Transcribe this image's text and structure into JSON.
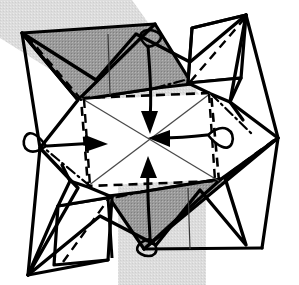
{
  "figure": {
    "name": "origami-step-diagram",
    "type": "line-drawing",
    "width": 299,
    "height": 285
  },
  "colors": {
    "background": "#ffffff",
    "backdrop_band": "#d9d9d9",
    "shaded_face": "#9a9a9a",
    "shaded_face_dark": "#8e8e8e",
    "white_face": "#ffffff",
    "outline": "#000000",
    "thin_line": "#4a4a4a",
    "arrow": "#000000"
  },
  "geometry": {
    "backdrop_band": {
      "name": "background-shadow-band",
      "points": "0,0 132,0 206,104 206,285 118,285 118,112 0,38"
    },
    "outer_silhouette": {
      "name": "model-outer-outline",
      "points": "22,33 78,100 40,148 78,188 28,275 100,216 156,245 200,190 246,245 225,178 278,138 230,102 246,15 190,62 136,34 96,80"
    },
    "faces": [
      {
        "name": "face-top-left-shaded",
        "fill": "shaded_face",
        "points": "22,33 155,24 157,88 78,100"
      },
      {
        "name": "face-top-middle-shaded",
        "fill": "shaded_face",
        "points": "78,100 157,88 192,84 155,24"
      },
      {
        "name": "face-top-right-white",
        "fill": "white_face",
        "points": "192,28 246,15 241,76 188,83"
      },
      {
        "name": "face-top-right-lower-white",
        "fill": "white_face",
        "points": "188,83 241,76 230,102 211,94"
      },
      {
        "name": "face-bottom-right-shaded",
        "fill": "shaded_face",
        "points": "278,138 141,249 144,192 221,179"
      },
      {
        "name": "face-bottom-middle-shaded",
        "fill": "shaded_face",
        "points": "221,179 144,192 108,196 144,249"
      },
      {
        "name": "face-bottom-left-white",
        "fill": "white_face",
        "points": "108,196 58,206 62,265 112,196"
      },
      {
        "name": "face-centre-white",
        "fill": "white_face",
        "points": "78,100 211,94 221,179 88,186"
      }
    ],
    "dashed_inner_square": {
      "name": "inner-fold-square",
      "points": "81,98 211,93 219,181 88,186"
    },
    "thin_diagonals": [
      {
        "name": "diagonal-nw-se",
        "x1": 81,
        "y1": 98,
        "x2": 219,
        "y2": 181
      },
      {
        "name": "diagonal-ne-sw",
        "x1": 211,
        "y1": 93,
        "x2": 88,
        "y2": 186
      }
    ],
    "dashed_fold_lines": [
      {
        "name": "dash-tl-diagonal",
        "x1": 27,
        "y1": 36,
        "x2": 80,
        "y2": 98
      },
      {
        "name": "dash-tr-diagonal",
        "x1": 245,
        "y1": 18,
        "x2": 190,
        "y2": 82
      },
      {
        "name": "dash-bl-diagonal",
        "x1": 63,
        "y1": 262,
        "x2": 110,
        "y2": 197
      },
      {
        "name": "dash-br-diagonal",
        "x1": 274,
        "y1": 140,
        "x2": 220,
        "y2": 180
      },
      {
        "name": "dash-left-vertical",
        "x1": 84,
        "y1": 99,
        "x2": 90,
        "y2": 186
      },
      {
        "name": "dash-right-vertical",
        "x1": 209,
        "y1": 94,
        "x2": 215,
        "y2": 180
      }
    ],
    "dash_dot_lines": [
      {
        "name": "dashdot-left",
        "x1": 90,
        "y1": 186,
        "x2": 44,
        "y2": 148
      },
      {
        "name": "dashdot-top",
        "x1": 155,
        "y1": 88,
        "x2": 185,
        "y2": 80
      },
      {
        "name": "dashdot-right",
        "x1": 211,
        "y1": 94,
        "x2": 252,
        "y2": 134
      },
      {
        "name": "dashdot-bottom",
        "x1": 146,
        "y1": 191,
        "x2": 113,
        "y2": 198
      }
    ],
    "arrows": [
      {
        "name": "arrow-down",
        "direction": "down",
        "label": "fold top flap inward",
        "shaft": "M 148,46 C 150,70 152,95 150,118",
        "loop": "M 148,47 C 132,34 145,26 157,32 C 166,37 158,45 148,47",
        "head": "141,111 158,111 150,134"
      },
      {
        "name": "arrow-left",
        "direction": "left",
        "label": "fold right flap inward",
        "shaft": "M 207,135 C 190,137 175,138 160,138",
        "loop": "M 208,135 C 224,121 236,131 232,143 C 228,153 216,145 208,135",
        "head": "170,130 170,147 148,138"
      },
      {
        "name": "arrow-up",
        "direction": "up",
        "label": "fold bottom flap inward",
        "shaft": "M 150,238 C 149,215 147,192 148,172",
        "loop": "M 150,239 C 164,252 152,260 141,254 C 132,249 140,241 150,239",
        "head": "140,178 157,178 148,156"
      },
      {
        "name": "arrow-right",
        "direction": "right",
        "label": "fold left flap inward",
        "shaft": "M 47,146 C 64,145 80,144 96,143",
        "loop": "M 46,146 C 30,158 20,148 25,137 C 30,128 40,137 46,146",
        "head": "85,135 85,152 108,144"
      }
    ]
  },
  "annotations": {
    "arrow_count": 4,
    "shaded_flap_count": 2,
    "white_flap_count": 2,
    "symmetry": "180-degree rotational"
  }
}
